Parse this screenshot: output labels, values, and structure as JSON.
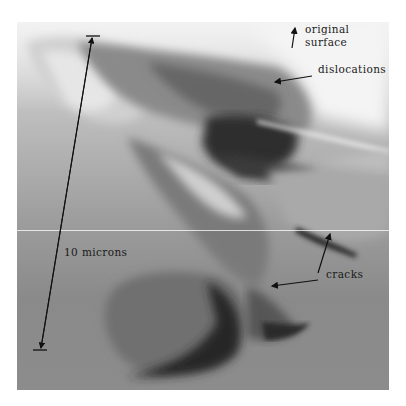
{
  "figure": {
    "type": "transmission electron micrograph",
    "annotations": {
      "original_surface": {
        "line1": "original",
        "line2": "surface"
      },
      "dislocations": "dislocations",
      "cracks": "cracks",
      "scale_bar": "10 microns"
    }
  }
}
